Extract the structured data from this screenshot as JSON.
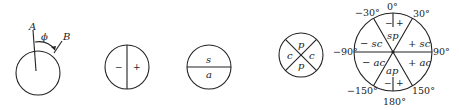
{
  "diagram": {
    "type": "angle-sign-conventions",
    "fig1": {
      "label_a": "A",
      "label_b": "B",
      "angle_label": "ϕ"
    },
    "fig2": {
      "left": "−",
      "right": "+"
    },
    "fig3": {
      "top": "s",
      "bottom": "a"
    },
    "fig4": {
      "top": "p",
      "bottom": "p",
      "left": "c",
      "right": "c"
    },
    "fig5": {
      "angles": {
        "top": "0°",
        "top_left": "−30°",
        "top_right": "30°",
        "left": "−90°",
        "right": "90°",
        "bottom_left": "−150°",
        "bottom_right": "150°",
        "bottom": "180°"
      },
      "sectors": {
        "top": "sp",
        "top_left": "− sc",
        "top_right": "+ sc",
        "bottom_left": "− ac",
        "bottom_right": "+ ac",
        "bottom": "ap"
      },
      "signs": {
        "top_minus": "−",
        "top_plus": "+",
        "bottom_minus": "−",
        "bottom_plus": "+"
      }
    }
  }
}
